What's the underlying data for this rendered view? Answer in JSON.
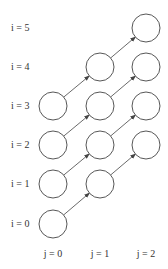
{
  "row_labels": [
    "i = 0",
    "i = 1",
    "i = 2",
    "i = 3",
    "i = 4",
    "i = 5"
  ],
  "col_labels": [
    "j = 0",
    "j = 1",
    "j = 2"
  ],
  "nodes": [
    {
      "i": 0,
      "j": 0
    },
    {
      "i": 1,
      "j": 0
    },
    {
      "i": 2,
      "j": 0
    },
    {
      "i": 3,
      "j": 0
    },
    {
      "i": 1,
      "j": 1
    },
    {
      "i": 2,
      "j": 1
    },
    {
      "i": 3,
      "j": 1
    },
    {
      "i": 4,
      "j": 1
    },
    {
      "i": 2,
      "j": 2
    },
    {
      "i": 3,
      "j": 2
    },
    {
      "i": 4,
      "j": 2
    },
    {
      "i": 5,
      "j": 2
    }
  ],
  "edges": [
    {
      "from": [
        0,
        0
      ],
      "to": [
        1,
        1
      ]
    },
    {
      "from": [
        1,
        0
      ],
      "to": [
        2,
        1
      ]
    },
    {
      "from": [
        2,
        0
      ],
      "to": [
        3,
        1
      ]
    },
    {
      "from": [
        3,
        0
      ],
      "to": [
        4,
        1
      ]
    },
    {
      "from": [
        1,
        1
      ],
      "to": [
        2,
        2
      ]
    },
    {
      "from": [
        2,
        1
      ],
      "to": [
        3,
        2
      ]
    },
    {
      "from": [
        3,
        1
      ],
      "to": [
        4,
        2
      ]
    },
    {
      "from": [
        4,
        1
      ],
      "to": [
        5,
        2
      ]
    }
  ],
  "colors": {
    "stroke": "#444444",
    "text": "#333333"
  }
}
